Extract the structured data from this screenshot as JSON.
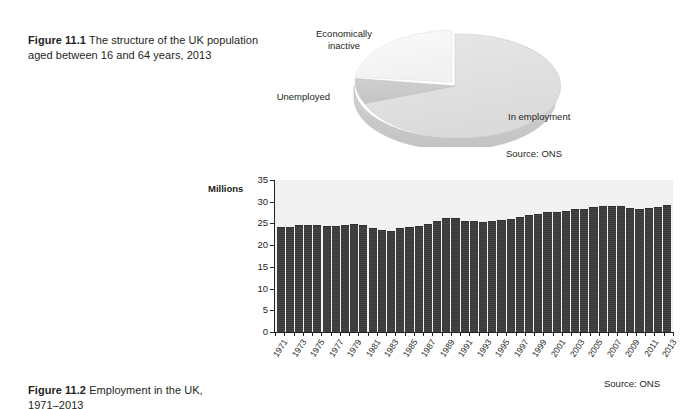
{
  "figure1": {
    "label": "Figure 11.1",
    "caption": "The structure of the UK population aged between 16 and 64 years, 2013",
    "source": "Source: ONS",
    "labels": {
      "inactive": "Economically\ninactive",
      "inactive_line1": "Economically",
      "inactive_line2": "inactive",
      "unemployed": "Unemployed",
      "in_employment": "In employment"
    },
    "chart_data": {
      "type": "pie",
      "title": "The structure of the UK population aged between 16 and 64 years, 2013",
      "labels": [
        "In employment",
        "Unemployed",
        "Economically inactive"
      ],
      "values": [
        71.5,
        5.5,
        23.0
      ],
      "unit": "percent",
      "colors": [
        "#e2e2e2",
        "#c9c9c9",
        "#f7f7f7"
      ],
      "legend": "none",
      "annotations": [
        "Source: ONS"
      ],
      "style": "3d-pie"
    }
  },
  "figure2": {
    "label": "Figure 11.2",
    "caption": "Employment in the UK, 1971–2013",
    "axis_title": "Millions",
    "source": "Source: ONS",
    "chart_data": {
      "type": "bar",
      "title": "Employment in the UK, 1971–2013",
      "xlabel": "",
      "ylabel": "Millions",
      "ylim": [
        0,
        35
      ],
      "yticks": [
        0,
        5,
        10,
        15,
        20,
        25,
        30,
        35
      ],
      "grid": false,
      "legend": "none",
      "bar_color": "#3f3f41",
      "tick_label_interval": 2,
      "categories": [
        "1971",
        "1972",
        "1973",
        "1974",
        "1975",
        "1976",
        "1977",
        "1978",
        "1979",
        "1980",
        "1981",
        "1982",
        "1983",
        "1984",
        "1985",
        "1986",
        "1987",
        "1988",
        "1989",
        "1990",
        "1991",
        "1992",
        "1993",
        "1994",
        "1995",
        "1996",
        "1997",
        "1998",
        "1999",
        "2000",
        "2001",
        "2002",
        "2003",
        "2004",
        "2005",
        "2006",
        "2007",
        "2008",
        "2009",
        "2010",
        "2011",
        "2012",
        "2013"
      ],
      "tick_labels": [
        "1971",
        "1973",
        "1975",
        "1977",
        "1979",
        "1981",
        "1983",
        "1985",
        "1987",
        "1989",
        "1991",
        "1993",
        "1995",
        "1997",
        "1999",
        "2001",
        "2003",
        "2005",
        "2007",
        "2009",
        "2011",
        "2013"
      ],
      "values": [
        24.0,
        24.0,
        24.4,
        24.4,
        24.4,
        24.1,
        24.2,
        24.3,
        24.6,
        24.5,
        23.7,
        23.2,
        23.1,
        23.7,
        24.0,
        24.2,
        24.6,
        25.4,
        26.1,
        26.1,
        25.4,
        25.3,
        25.1,
        25.3,
        25.6,
        25.9,
        26.3,
        26.6,
        27.0,
        27.3,
        27.5,
        27.7,
        28.0,
        28.2,
        28.5,
        28.7,
        28.8,
        28.9,
        28.3,
        28.2,
        28.3,
        28.6,
        29.1
      ]
    }
  }
}
